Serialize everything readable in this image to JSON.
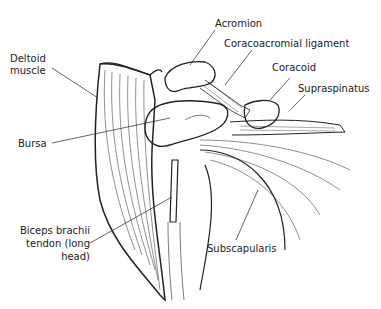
{
  "diagram": {
    "labels": {
      "acromion": "Acromion",
      "coracoacromial_ligament": "Coracoacromial ligament",
      "coracoid": "Coracoid",
      "supraspinatus": "Supraspinatus",
      "deltoid_line1": "Deltoid",
      "deltoid_line2": "muscle",
      "bursa": "Bursa",
      "biceps_line1": "Biceps brachii",
      "biceps_line2": "tendon (long",
      "biceps_line3": "head)",
      "subscapularis": "Subscapularis"
    },
    "colors": {
      "ink": "#222222",
      "background": "#ffffff"
    }
  }
}
